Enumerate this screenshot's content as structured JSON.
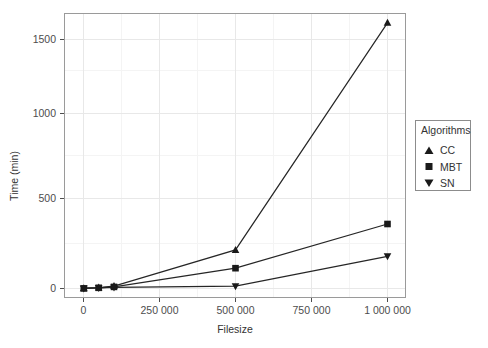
{
  "chart_data": {
    "type": "line",
    "title": "",
    "subtitle": "",
    "xlabel": "Filesize",
    "ylabel": "Time (min)",
    "xlim": [
      -35000,
      1080000
    ],
    "ylim": [
      -60,
      1660
    ],
    "xticks": [
      0,
      250000,
      500000,
      750000,
      1000000
    ],
    "xticklabels": [
      "0",
      "250 000",
      "500 000",
      "750 000",
      "1 000 000"
    ],
    "yticks": [
      0,
      500,
      1000,
      1500
    ],
    "yticklabels": [
      "0",
      "500",
      "1000",
      "1500"
    ],
    "grid": true,
    "grid_major": true,
    "grid_minor": true,
    "legend_position": "right",
    "legend_title": "Algorithms",
    "x": [
      1000,
      50000,
      100000,
      500000,
      1000000
    ],
    "series": [
      {
        "name": "CC",
        "marker": "triangle-up",
        "values": [
          2,
          6,
          14,
          228,
          1570
        ]
      },
      {
        "name": "MBT",
        "marker": "square",
        "values": [
          1,
          4,
          9,
          118,
          396
        ]
      },
      {
        "name": "SN",
        "marker": "triangle-down",
        "values": [
          1,
          3,
          6,
          13,
          180
        ]
      }
    ]
  },
  "legend": {
    "title": "Algorithms",
    "entries": [
      {
        "label": "CC",
        "marker": "triangle-up-icon"
      },
      {
        "label": "MBT",
        "marker": "square-icon"
      },
      {
        "label": "SN",
        "marker": "triangle-down-icon"
      }
    ]
  },
  "axes": {
    "x_title": "Filesize",
    "y_title": "Time (min)",
    "x_tick_labels": [
      "0",
      "250 000",
      "500 000",
      "750 000",
      "1 000 000"
    ],
    "y_tick_labels": [
      "0",
      "500",
      "1000",
      "1500"
    ]
  },
  "colors": {
    "line": "#262626",
    "marker": "#1a1a1a",
    "grid_major": "#e8e8e8",
    "grid_minor": "#f4f4f4",
    "panel_border": "#9a9a9a",
    "text": "#333333",
    "background": "#ffffff"
  }
}
